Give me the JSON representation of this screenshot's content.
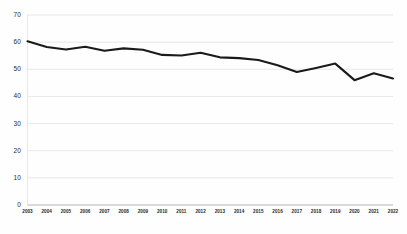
{
  "chart_data": {
    "type": "line",
    "title": "",
    "subtitle": "",
    "xlabel": "",
    "ylabel": "",
    "grid": true,
    "legend": false,
    "legend_position": "none",
    "line_color": "#1a1a1a",
    "gridline_color": "#dedede",
    "background_color": "#fefefe",
    "ylim": [
      0,
      70
    ],
    "yticks": [
      0,
      10,
      20,
      30,
      40,
      50,
      60,
      70
    ],
    "ytick_labels": [
      "0",
      "10",
      "20",
      "30",
      "40",
      "50",
      "60",
      "70"
    ],
    "categories": [
      "2003",
      "2004",
      "2005",
      "2006",
      "2007",
      "2008",
      "2009",
      "2010",
      "2011",
      "2012",
      "2013",
      "2014",
      "2015",
      "2016",
      "2017",
      "2018",
      "2019",
      "2020",
      "2021",
      "2022"
    ],
    "series": [
      {
        "name": "series-1",
        "values": [
          60.3,
          58.2,
          57.3,
          58.3,
          56.8,
          57.7,
          57.2,
          55.3,
          55.1,
          56.1,
          54.4,
          54.1,
          53.4,
          51.5,
          49.0,
          50.5,
          52.1,
          46.0,
          48.5,
          46.6
        ]
      }
    ]
  }
}
